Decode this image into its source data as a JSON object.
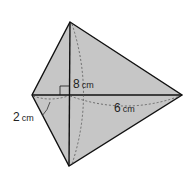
{
  "diagram": {
    "type": "kite-quadrilateral",
    "colors": {
      "fill": "#c6c6c6",
      "stroke": "#111111",
      "dashed": "#555555"
    },
    "vertices": {
      "top": [
        70,
        22
      ],
      "left": [
        32,
        95
      ],
      "right": [
        182,
        95
      ],
      "bottom": [
        69,
        166
      ],
      "center": [
        69,
        95
      ]
    },
    "labels": {
      "vertical_diagonal": {
        "value": "8",
        "unit": "cm"
      },
      "right_segment": {
        "value": "6",
        "unit": "cm"
      },
      "left_segment": {
        "value": "2",
        "unit": "cm"
      }
    },
    "right_angle_marker": true
  }
}
